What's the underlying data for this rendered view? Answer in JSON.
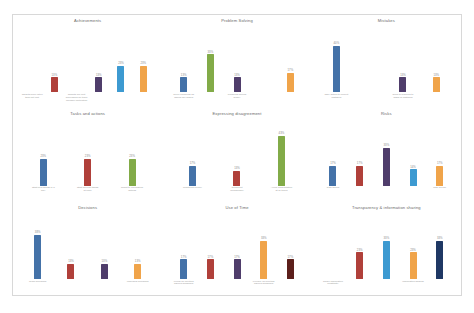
{
  "page": {
    "background": "#ffffff",
    "border_color": "#d8d8d8"
  },
  "palette": {
    "blue": "#4472a8",
    "light_blue": "#3d9ad1",
    "red": "#b0403a",
    "purple": "#4f3d6b",
    "orange": "#f0a44a",
    "green": "#82ab48",
    "navy": "#1f3864",
    "dark_red": "#5c1f1b",
    "value_label": "#8a8a8a",
    "category_label": "#9a9a9a",
    "title": "#6a6a6a"
  },
  "chart_data": [
    {
      "type": "bar",
      "title": "Achievements",
      "xlabel": "",
      "ylabel": "",
      "ylim": [
        0,
        100
      ],
      "grid": false,
      "legend": "none",
      "categories": [
        "Targets more often than not met",
        "",
        "Targets are met depending on team member motivation"
      ],
      "bar_labels": [
        "",
        "13%",
        "",
        "13%",
        "23%",
        "23%"
      ],
      "values": [
        0,
        13,
        0,
        13,
        23,
        23
      ],
      "colors": [
        "none",
        "red",
        "none",
        "purple",
        "light_blue",
        "orange"
      ]
    },
    {
      "type": "bar",
      "title": "Problem Solving",
      "xlabel": "",
      "ylabel": "",
      "ylim": [
        0,
        100
      ],
      "grid": false,
      "legend": "none",
      "categories": [
        "Solve problems as issues are raised",
        "",
        "Problems solved slowly"
      ],
      "bar_labels": [
        "13%",
        "33%",
        "13%",
        "",
        "17%"
      ],
      "values": [
        13,
        33,
        13,
        0,
        17
      ],
      "colors": [
        "blue",
        "green",
        "purple",
        "none",
        "orange"
      ]
    },
    {
      "type": "bar",
      "title": "Mistakes",
      "xlabel": "",
      "ylabel": "",
      "ylim": [
        0,
        100
      ],
      "grid": false,
      "legend": "none",
      "categories": [
        "Take action to correct mistakes",
        "",
        "Slow to respond to signs of mistakes"
      ],
      "bar_labels": [
        "40%",
        "",
        "13%",
        "13%"
      ],
      "values": [
        40,
        0,
        13,
        13
      ],
      "colors": [
        "blue",
        "none",
        "purple",
        "orange"
      ]
    },
    {
      "type": "bar",
      "title": "Tasks and actions",
      "xlabel": "",
      "ylabel": "",
      "ylim": [
        0,
        100
      ],
      "grid": false,
      "legend": "none",
      "categories": [
        "Start new things in a way",
        "Start several things at once",
        "React to colleagues' actions"
      ],
      "bar_labels": [
        "23%",
        "23%",
        "23%"
      ],
      "values": [
        23,
        23,
        23
      ],
      "colors": [
        "blue",
        "red",
        "green"
      ]
    },
    {
      "type": "bar",
      "title": "Expressing disagreement",
      "xlabel": "",
      "ylabel": "",
      "ylim": [
        0,
        100
      ],
      "grid": false,
      "legend": "none",
      "categories": [
        "Comment openly",
        "Comment occasionally",
        "Avoid confrontation at all times"
      ],
      "bar_labels": [
        "17%",
        "13%",
        "43%"
      ],
      "values": [
        17,
        13,
        43
      ],
      "colors": [
        "blue",
        "red",
        "green"
      ]
    },
    {
      "type": "bar",
      "title": "Risks",
      "xlabel": "",
      "ylabel": "",
      "ylim": [
        0,
        100
      ],
      "grid": false,
      "legend": "none",
      "categories": [
        "Risk taking",
        "",
        "",
        "",
        "Risk averse"
      ],
      "bar_labels": [
        "17%",
        "17%",
        "33%",
        "14%",
        "17%"
      ],
      "values": [
        17,
        17,
        33,
        14,
        17
      ],
      "colors": [
        "blue",
        "red",
        "purple",
        "light_blue",
        "orange"
      ]
    },
    {
      "type": "bar",
      "title": "Decisions",
      "xlabel": "",
      "ylabel": "",
      "ylim": [
        0,
        100
      ],
      "grid": false,
      "legend": "none",
      "categories": [
        "Team decisions",
        "",
        "",
        "Individual decisions"
      ],
      "bar_labels": [
        "38%",
        "13%",
        "13%",
        "13%"
      ],
      "values": [
        38,
        13,
        13,
        13
      ],
      "colors": [
        "blue",
        "red",
        "purple",
        "orange"
      ]
    },
    {
      "type": "bar",
      "title": "Use of Time",
      "xlabel": "",
      "ylabel": "",
      "ylim": [
        0,
        100
      ],
      "grid": false,
      "legend": "none",
      "categories": [
        "Focus on meeting agreed deadlines",
        "",
        "",
        "Flexible on meeting agreed deadlines",
        ""
      ],
      "bar_labels": [
        "17%",
        "17%",
        "17%",
        "33%",
        "17%"
      ],
      "values": [
        17,
        17,
        17,
        33,
        17
      ],
      "colors": [
        "blue",
        "red",
        "purple",
        "orange",
        "dark_red"
      ]
    },
    {
      "type": "bar",
      "title": "Transparency & information sharing",
      "xlabel": "",
      "ylabel": "",
      "ylim": [
        0,
        100
      ],
      "grid": false,
      "legend": "none",
      "categories": [
        "Share information constantly",
        "",
        "",
        "Information sharing"
      ],
      "bar_labels": [
        "",
        "23%",
        "33%",
        "23%",
        "33%"
      ],
      "values": [
        0,
        23,
        33,
        23,
        33
      ],
      "colors": [
        "none",
        "red",
        "light_blue",
        "orange",
        "navy"
      ]
    }
  ]
}
